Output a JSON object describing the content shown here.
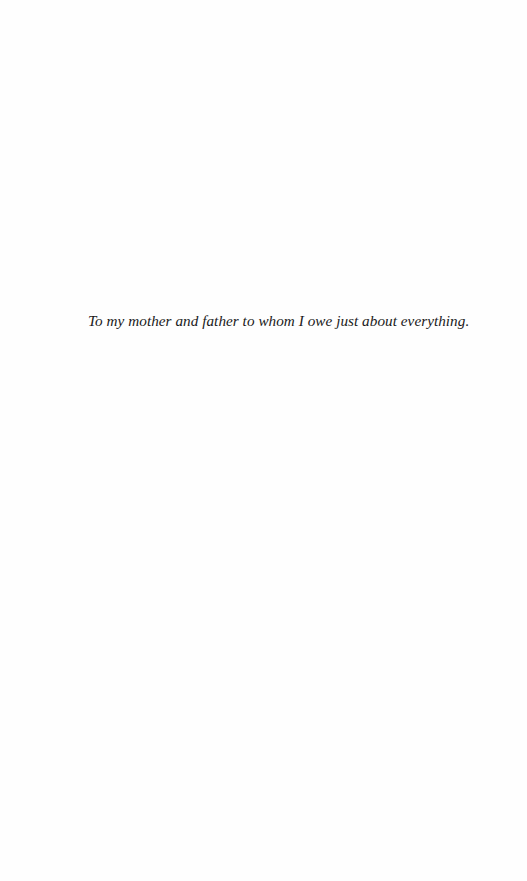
{
  "page": {
    "type": "dedication",
    "background_color": "#fefefe",
    "text_color": "#1a1a1a"
  },
  "dedication": {
    "text": "To my mother and father to whom I owe just about everything."
  }
}
